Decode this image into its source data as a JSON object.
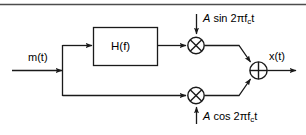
{
  "figure": {
    "type": "block-diagram",
    "top_rule": true,
    "line_color": "#1a1a1a",
    "text_color": "#000000",
    "background": "#ffffff"
  },
  "labels": {
    "input": "m(t)",
    "filter_block": "H(f)",
    "output": "x(t)",
    "carrier_top_amplitude": "A",
    "carrier_top_expr": " sin 2πf",
    "carrier_top_sub": "c",
    "carrier_top_tail": "t",
    "carrier_bottom_amplitude": "A",
    "carrier_bottom_expr": " cos 2πf",
    "carrier_bottom_sub": "c",
    "carrier_bottom_tail": "t"
  },
  "nodes": [
    {
      "name": "input-arrow",
      "kind": "signal-input",
      "label": "m(t)"
    },
    {
      "name": "branch-node",
      "kind": "junction"
    },
    {
      "name": "filter-block",
      "kind": "block",
      "label": "H(f)"
    },
    {
      "name": "multiplier-top",
      "kind": "multiplier",
      "glyph": "⊗"
    },
    {
      "name": "multiplier-bottom",
      "kind": "multiplier",
      "glyph": "⊗"
    },
    {
      "name": "summer",
      "kind": "adder",
      "glyph": "⊕"
    },
    {
      "name": "output-arrow",
      "kind": "signal-output",
      "label": "x(t)"
    }
  ],
  "icons": {
    "multiplier": "circle-times-icon",
    "adder": "circle-plus-icon",
    "arrow": "arrowhead-icon"
  }
}
